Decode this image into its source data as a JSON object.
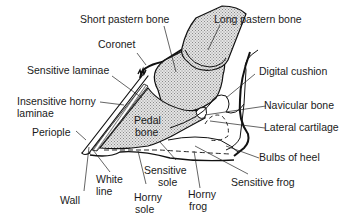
{
  "diagram": {
    "colors": {
      "line": "#111111",
      "bone_fill": "#bdbdbd",
      "background": "#ffffff"
    },
    "labels": {
      "short_pastern_bone": "Short pastern bone",
      "long_pastern_bone": "Long pastern bone",
      "coronet": "Coronet",
      "digital_cushion": "Digital cushion",
      "sensitive_laminae": "Sensitive laminae",
      "insensitive_horny_laminae_1": "Insensitive horny",
      "insensitive_horny_laminae_2": "laminae",
      "navicular_bone": "Navicular bone",
      "pedal_bone_1": "Pedal",
      "pedal_bone_2": "bone",
      "lateral_cartilage": "Lateral cartilage",
      "periople": "Periople",
      "bulbs_of_heel": "Bulbs of heel",
      "sensitive_sole_1": "Sensitive",
      "sensitive_sole_2": "sole",
      "white_line_1": "White",
      "white_line_2": "line",
      "sensitive_frog": "Sensitive frog",
      "wall": "Wall",
      "horny_sole_1": "Horny",
      "horny_sole_2": "sole",
      "horny_frog_1": "Horny",
      "horny_frog_2": "frog"
    }
  }
}
